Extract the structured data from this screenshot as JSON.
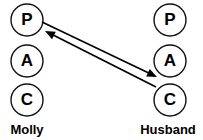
{
  "diagram": {
    "background_color": "#ffffff",
    "line_color": "#000000",
    "circle_fill": "#ffffff",
    "circle_stroke": "#111111",
    "columns": [
      {
        "person_label": "Molly",
        "label_x": 27,
        "label_y": 134,
        "ego_states": [
          {
            "letter": "P",
            "name": "parent",
            "cx": 27,
            "cy": 20,
            "r": 16
          },
          {
            "letter": "A",
            "name": "adult",
            "cx": 27,
            "cy": 61,
            "r": 16
          },
          {
            "letter": "C",
            "name": "child",
            "cx": 27,
            "cy": 100,
            "r": 16
          }
        ]
      },
      {
        "person_label": "Husband",
        "label_x": 168,
        "label_y": 134,
        "ego_states": [
          {
            "letter": "P",
            "name": "parent",
            "cx": 170,
            "cy": 20,
            "r": 16
          },
          {
            "letter": "A",
            "name": "adult",
            "cx": 170,
            "cy": 61,
            "r": 16
          },
          {
            "letter": "C",
            "name": "child",
            "cx": 170,
            "cy": 100,
            "r": 16
          }
        ]
      }
    ],
    "transactions": [
      {
        "name": "molly-parent-to-husband-child",
        "from": "Molly Parent",
        "to": "Husband Child",
        "x1": 42,
        "y1": 22,
        "x2": 157,
        "y2": 77,
        "arrow_at": "end"
      },
      {
        "name": "husband-child-to-molly-parent",
        "from": "Husband Child",
        "to": "Molly Parent",
        "x1": 156,
        "y1": 87,
        "x2": 45,
        "y2": 31,
        "arrow_at": "end"
      }
    ]
  }
}
